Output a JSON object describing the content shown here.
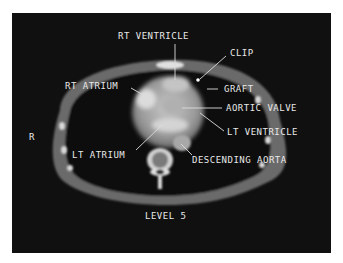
{
  "image": {
    "type": "CT axial scan of chest",
    "background_color": "#101010",
    "frame_color": "#ffffff"
  },
  "labels": {
    "rt_ventricle": "RT VENTRICLE",
    "clip": "CLIP",
    "graft": "GRAFT",
    "rt_atrium": "RT ATRIUM",
    "aortic_valve": "AORTIC VALVE",
    "lt_ventricle": "LT VENTRICLE",
    "lt_atrium": "LT ATRIUM",
    "descending_aorta": "DESCENDING AORTA",
    "orientation_r": "R",
    "level": "LEVEL 5"
  }
}
